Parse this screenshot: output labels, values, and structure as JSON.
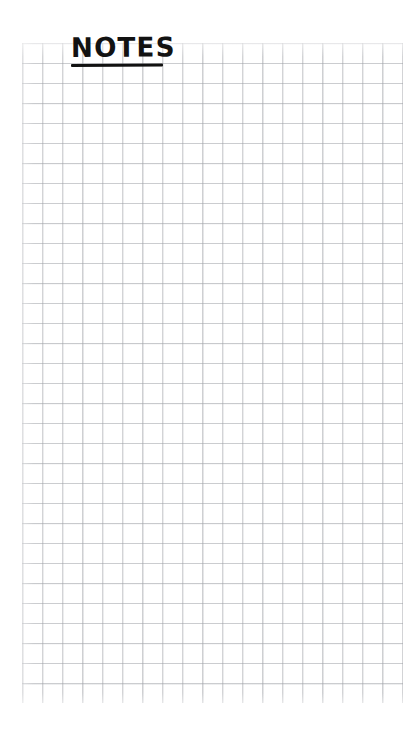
{
  "page": {
    "background_color": "#ffffff",
    "width": 403,
    "height": 730
  },
  "title": {
    "text": "NOTES",
    "color": "#121212",
    "style": "handwritten-bold-underlined"
  },
  "grid": {
    "label": "graph-paper-grid",
    "cell_size_px": 20,
    "columns": 19,
    "rows": 33,
    "line_color": "#d6d8dc",
    "left_px": 22,
    "top_px": 43,
    "width_px": 381,
    "height_px": 660
  },
  "notes": {
    "lines": []
  }
}
